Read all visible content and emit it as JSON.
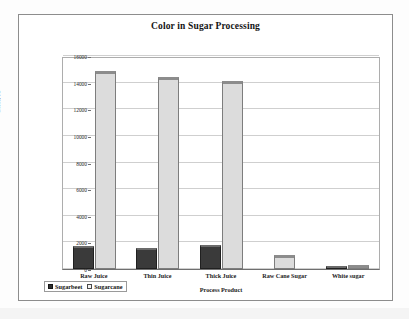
{
  "chart_data": {
    "type": "bar",
    "title": "Color in Sugar Processing",
    "xlabel": "Process Product",
    "ylabel": "Color, IU",
    "categories": [
      "Raw Juice",
      "Thin Juice",
      "Thick Juice",
      "Raw Cane Sugar",
      "White sugar"
    ],
    "series": [
      {
        "name": "Sugarbeet",
        "color": "#2f2f2f",
        "values": [
          1700,
          1600,
          1800,
          0,
          100
        ]
      },
      {
        "name": "Sugarcane",
        "color": "#dcdcdc",
        "values": [
          14900,
          14400,
          14100,
          1050,
          50
        ]
      }
    ],
    "ylim": [
      0,
      16000
    ],
    "yticks": [
      "0",
      "2000",
      "4000",
      "6000",
      "8000",
      "10000",
      "12000",
      "14000",
      "16000"
    ],
    "ytick_values": [
      0,
      2000,
      4000,
      6000,
      8000,
      10000,
      12000,
      14000,
      16000
    ],
    "grid": true,
    "legend_position": "bottom-left"
  },
  "legend": {
    "items": [
      {
        "label": "Sugarbeet",
        "swatch": "filled-dark-square"
      },
      {
        "label": "Sugarcane",
        "swatch": "hollow-light-square"
      }
    ]
  }
}
